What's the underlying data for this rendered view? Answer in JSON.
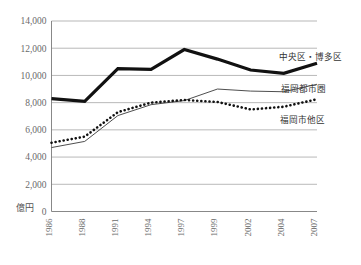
{
  "chart_data": {
    "type": "line",
    "title": "",
    "xlabel": "",
    "ylabel": "億円",
    "unit_label": "億円",
    "categories": [
      "1986",
      "1988",
      "1991",
      "1994",
      "1997",
      "1999",
      "2002",
      "2004",
      "2007"
    ],
    "x": [
      1986,
      1988,
      1991,
      1994,
      1997,
      1999,
      2002,
      2004,
      2007
    ],
    "ylim": [
      0,
      14000
    ],
    "ytick_labels": [
      "14,000",
      "12,000",
      "10,000",
      "8,000",
      "6,000",
      "4,000",
      "2,000",
      "0"
    ],
    "ytick_values": [
      14000,
      12000,
      10000,
      8000,
      6000,
      4000,
      2000,
      0
    ],
    "grid": "horizontal",
    "legend_position": "right-inline",
    "series": [
      {
        "name": "中央区・博多区",
        "label": "中央区・博多区",
        "style": "bold-solid",
        "values": [
          8300,
          8100,
          10500,
          10450,
          11900,
          11200,
          10400,
          10150,
          10900
        ]
      },
      {
        "name": "福岡都市圏",
        "label": "福岡都市圏",
        "style": "thin-solid",
        "values": [
          4700,
          5150,
          7050,
          7850,
          8150,
          9000,
          8850,
          8800,
          9350
        ]
      },
      {
        "name": "福岡市他区",
        "label": "福岡市他区",
        "style": "dotted",
        "values": [
          5050,
          5500,
          7300,
          8000,
          8200,
          8050,
          7500,
          7700,
          8250
        ]
      }
    ]
  },
  "legend": {
    "items": [
      {
        "label": "中央区・博多区"
      },
      {
        "label": "福岡都市圏"
      },
      {
        "label": "福岡市他区"
      }
    ]
  },
  "axes": {
    "y": {
      "unit": "億円",
      "zero_label": "0"
    }
  }
}
